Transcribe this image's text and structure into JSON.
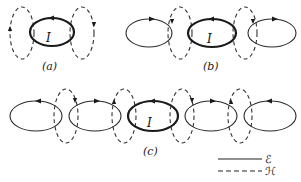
{
  "figure": {
    "panels": [
      {
        "id": "a",
        "label": "(a)",
        "current_label": "I",
        "solid_loops": [
          {
            "cx": 52,
            "cy": 32,
            "rx": 22,
            "ry": 14,
            "thick": true,
            "arrow": "left"
          }
        ],
        "dashed_loops": [
          {
            "cx": 22,
            "cy": 33,
            "rx": 12,
            "ry": 26,
            "arrow": "up-left"
          },
          {
            "cx": 82,
            "cy": 33,
            "rx": 12,
            "ry": 26,
            "arrow": "down-right"
          }
        ]
      },
      {
        "id": "b",
        "label": "(b)",
        "current_label": "I",
        "solid_loops": [
          {
            "cx": 149,
            "cy": 33,
            "rx": 23,
            "ry": 14,
            "thick": false,
            "arrow": "right"
          },
          {
            "cx": 212,
            "cy": 33,
            "rx": 24,
            "ry": 14,
            "thick": true,
            "arrow": "left"
          },
          {
            "cx": 272,
            "cy": 33,
            "rx": 24,
            "ry": 14,
            "thick": false,
            "arrow": "right"
          }
        ],
        "dashed_loops": [
          {
            "cx": 180,
            "cy": 33,
            "rx": 12,
            "ry": 26,
            "arrow": "down"
          },
          {
            "cx": 245,
            "cy": 33,
            "rx": 12,
            "ry": 26,
            "arrow": "down"
          }
        ]
      },
      {
        "id": "c",
        "label": "(c)",
        "current_label": "I",
        "solid_loops": [
          {
            "cx": 36,
            "cy": 116,
            "rx": 26,
            "ry": 15,
            "thick": false,
            "arrow": "left"
          },
          {
            "cx": 95,
            "cy": 116,
            "rx": 26,
            "ry": 15,
            "thick": false,
            "arrow": "right"
          },
          {
            "cx": 153,
            "cy": 116,
            "rx": 25,
            "ry": 15,
            "thick": true,
            "arrow": "left"
          },
          {
            "cx": 211,
            "cy": 116,
            "rx": 26,
            "ry": 15,
            "thick": false,
            "arrow": "right"
          },
          {
            "cx": 270,
            "cy": 116,
            "rx": 26,
            "ry": 15,
            "thick": false,
            "arrow": "left"
          }
        ],
        "dashed_loops": [
          {
            "cx": 66,
            "cy": 116,
            "rx": 12,
            "ry": 27,
            "arrow": "down"
          },
          {
            "cx": 124,
            "cy": 116,
            "rx": 12,
            "ry": 27,
            "arrow": "up"
          },
          {
            "cx": 182,
            "cy": 116,
            "rx": 12,
            "ry": 27,
            "arrow": "down"
          },
          {
            "cx": 240,
            "cy": 116,
            "rx": 12,
            "ry": 27,
            "arrow": "up"
          }
        ]
      }
    ],
    "legend": [
      {
        "style": "solid",
        "label": "ℰ"
      },
      {
        "style": "dashed",
        "label": "ℋ"
      }
    ]
  }
}
